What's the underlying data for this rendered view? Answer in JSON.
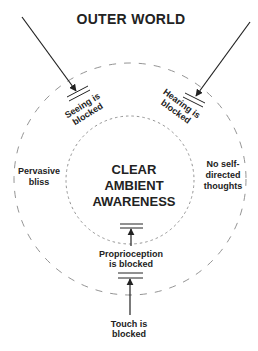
{
  "title": "OUTER WORLD",
  "center": {
    "lines": [
      "CLEAR",
      "AMBIENT",
      "AWARENESS"
    ]
  },
  "labels": {
    "seeing": [
      "Seeing is",
      "blocked"
    ],
    "hearing": [
      "Hearing is",
      "blocked"
    ],
    "pervasive": [
      "Pervasive",
      "bliss"
    ],
    "no_self": [
      "No self-",
      "directed",
      "thoughts"
    ],
    "proprioception": [
      "Proprioception",
      "is blocked"
    ],
    "touch": [
      "Touch is",
      "blocked"
    ]
  },
  "colors": {
    "ink": "#222222",
    "circle": "#888888",
    "background": "#ffffff"
  }
}
